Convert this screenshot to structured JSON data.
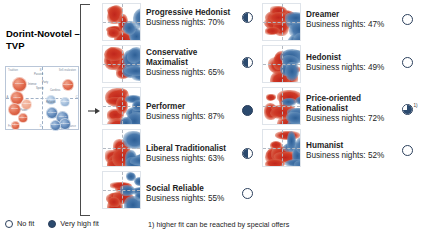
{
  "title": "Dorint-Novotel – TVP",
  "mini_chart": {
    "axis_labels": {
      "top_left": "Tradition",
      "top_mid": "B",
      "top_right": "Self-realization",
      "mid_left": "A",
      "mid_right": "C",
      "bottom_left": "Frugal",
      "bottom_mid": "D",
      "bottom_right": "Sustenance"
    },
    "bubbles": [
      {
        "label": "Conservative Maximalist",
        "color": "red",
        "x": 6,
        "y": 10,
        "size": 15
      },
      {
        "label": "Liberal Traditionalist",
        "color": "red",
        "x": 4,
        "y": 24,
        "size": 14
      },
      {
        "label": "Social Reliable",
        "color": "red",
        "x": 2,
        "y": 36,
        "size": 13
      },
      {
        "label": "Humanist",
        "color": "pale",
        "x": 15,
        "y": 32,
        "size": 11
      },
      {
        "label": "Dreamer",
        "color": "red",
        "x": 56,
        "y": 12,
        "size": 12
      },
      {
        "label": "Hedonist",
        "color": "pbl",
        "x": 40,
        "y": 28,
        "size": 10
      },
      {
        "label": "Progressive Hedonist",
        "color": "pbl",
        "x": 54,
        "y": 30,
        "size": 10
      },
      {
        "label": "Performer",
        "color": "blue",
        "x": 40,
        "y": 40,
        "size": 12
      },
      {
        "label": "Price-oriented Rationalist",
        "color": "blue",
        "x": 50,
        "y": 44,
        "size": 13
      },
      {
        "label": "Escapist",
        "color": "blue",
        "x": 53,
        "y": 51,
        "size": 12
      },
      {
        "label": "Consumption Materialist",
        "color": "blue",
        "x": 44,
        "y": 53,
        "size": 11
      },
      {
        "label": "Modern",
        "color": "red",
        "x": 12,
        "y": 46,
        "size": 10
      },
      {
        "label": "Entertainment",
        "color": "red",
        "x": 5,
        "y": 54,
        "size": 9
      }
    ],
    "text_markers": [
      "Passive",
      "Party",
      "Sporty",
      "Careless",
      "Intense",
      "Relaxed",
      "Power"
    ]
  },
  "segments_left": [
    {
      "name": "Progressive Hedonist",
      "stat": "Business nights: 70%",
      "fit": "half",
      "fit_value": 70
    },
    {
      "name": "Conservative Maximalist",
      "stat": "Business nights: 65%",
      "fit": "half",
      "fit_value": 65,
      "two_line": true
    },
    {
      "name": "Performer",
      "stat": "Business nights: 87%",
      "fit": "full",
      "fit_value": 87
    },
    {
      "name": "Liberal Traditionalist",
      "stat": "Business nights: 63%",
      "fit": "half",
      "fit_value": 63
    },
    {
      "name": "Social Reliable",
      "stat": "Business nights: 55%",
      "fit": "none",
      "fit_value": 55
    }
  ],
  "segments_right": [
    {
      "name": "Dreamer",
      "stat": "Business nights: 47%",
      "fit": "none",
      "fit_value": 47
    },
    {
      "name": "Hedonist",
      "stat": "Business nights: 49%",
      "fit": "none",
      "fit_value": 49
    },
    {
      "name": "Price-oriented Rationalist",
      "stat": "Business nights: 72%",
      "fit": "three-quarter",
      "fit_value": 72,
      "two_line": true,
      "footnote_marker": "1)"
    },
    {
      "name": "Humanist",
      "stat": "Business nights: 52%",
      "fit": "none",
      "fit_value": 52
    }
  ],
  "legend": {
    "no_fit": "No fit",
    "very_high_fit": "Very high fit"
  },
  "footnote": "1) higher fit can be reached by special offers",
  "colors": {
    "high_density_red": "#c0261c",
    "high_density_blue": "#2d5f96",
    "fit_fill": "#2b4a6e",
    "text": "#1d1d1d"
  }
}
